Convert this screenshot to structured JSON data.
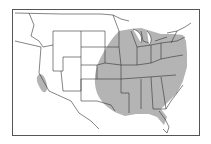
{
  "map": {
    "title": "",
    "region": "Contiguous United States",
    "colors": {
      "range_fill": "#b4b4b4",
      "border": "#333333",
      "background": "#ffffff"
    },
    "shaded_regions": [
      {
        "name": "eastern-range",
        "description": "Eastern US from Great Plains to Atlantic coast, excluding southern Florida"
      },
      {
        "name": "southwest-range",
        "description": "Small isolated patch in central Arizona"
      }
    ]
  }
}
